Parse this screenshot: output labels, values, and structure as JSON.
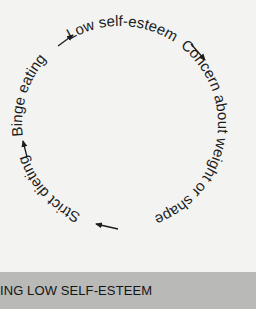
{
  "diagram": {
    "type": "cycle",
    "steps": [
      {
        "label": "Low self-esteem"
      },
      {
        "label": "Concern about weight or shape"
      },
      {
        "label": "Strict dieting"
      },
      {
        "label": "Binge eating"
      }
    ],
    "direction": "clockwise"
  },
  "footer": {
    "title": "ING LOW SELF-ESTEEM"
  },
  "colors": {
    "background": "#f3f3f1",
    "text": "#1c1c1c",
    "footer_bar": "#b9b9b7"
  }
}
